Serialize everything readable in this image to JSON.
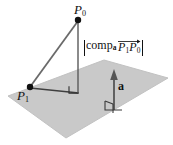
{
  "figure": {
    "background_color": "#ffffff",
    "plane": {
      "fill_color": "#c9c9c9",
      "edge_color": "#bdbdbd",
      "description": "gray parallelogram representing a plane"
    },
    "line_color": "#4a4a4a",
    "point_color": "#111111",
    "text_color": "#111111"
  },
  "labels": {
    "p0": {
      "base": "P",
      "sub": "0"
    },
    "p1": {
      "base": "P",
      "sub": "1"
    },
    "a": "a",
    "comp": {
      "open_bar": "|",
      "word": "comp",
      "word_sub": "a",
      "vec_p1": {
        "base": "P",
        "sub": "1"
      },
      "vec_p0": {
        "base": "P",
        "sub": "0"
      },
      "close_bar": "|",
      "full_text": "|comp_a P1P0|"
    }
  },
  "geometry": {
    "point_p0": {
      "x": 78,
      "y": 20
    },
    "point_p1": {
      "x": 30,
      "y": 87
    },
    "foot_of_perpendicular": {
      "x": 78,
      "y": 93
    },
    "vector_a_tail": {
      "x": 114,
      "y": 110
    },
    "vector_a_head": {
      "x": 114,
      "y": 70
    },
    "plane_corners": [
      {
        "x": 8,
        "y": 96
      },
      {
        "x": 104,
        "y": 60
      },
      {
        "x": 168,
        "y": 78
      },
      {
        "x": 66,
        "y": 138
      }
    ],
    "right_angle_markers": [
      {
        "name": "foot-right-angle",
        "x": 70,
        "y": 85
      },
      {
        "name": "vector-a-base-right-angle",
        "x": 106,
        "y": 102
      }
    ],
    "segments": [
      {
        "name": "p1-to-p0",
        "from": "point_p1",
        "to": "point_p0"
      },
      {
        "name": "p0-to-foot",
        "from": "point_p0",
        "to": "foot_of_perpendicular"
      },
      {
        "name": "p1-to-foot",
        "from": "point_p1",
        "to": "foot_of_perpendicular"
      }
    ]
  }
}
